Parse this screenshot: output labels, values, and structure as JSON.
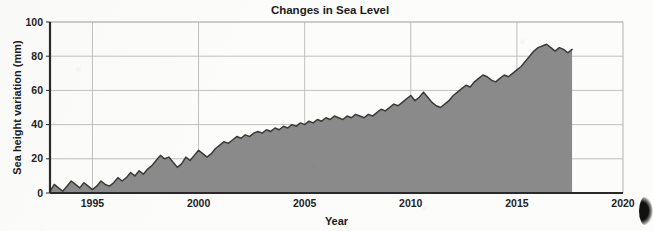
{
  "chart_data": {
    "type": "area",
    "title": "Changes in Sea Level",
    "xlabel": "Year",
    "ylabel": "Sea height variation (mm)",
    "xlim": [
      1993,
      2020
    ],
    "ylim": [
      0,
      100
    ],
    "xticks": [
      "1995",
      "2000",
      "2005",
      "2010",
      "2015",
      "2020"
    ],
    "xtick_values": [
      1995,
      2000,
      2005,
      2010,
      2015,
      2020
    ],
    "yticks": [
      "0",
      "20",
      "40",
      "60",
      "80",
      "100"
    ],
    "ytick_values": [
      0,
      20,
      40,
      60,
      80,
      100
    ],
    "grid": true,
    "legend": "none",
    "fill_color": "#8a8a8a",
    "line_color": "#3a3a3a",
    "grid_color": "#b9b9b9",
    "axis_color": "#2a2a2a",
    "data_start_year": 1993.0,
    "data_end_year": 2017.6,
    "series": [
      {
        "name": "Sea height variation",
        "units": "mm",
        "x": [
          1993.0,
          1993.2,
          1993.4,
          1993.6,
          1993.8,
          1994.0,
          1994.2,
          1994.4,
          1994.6,
          1994.8,
          1995.0,
          1995.2,
          1995.4,
          1995.6,
          1995.8,
          1996.0,
          1996.2,
          1996.4,
          1996.6,
          1996.8,
          1997.0,
          1997.2,
          1997.4,
          1997.6,
          1997.8,
          1998.0,
          1998.2,
          1998.4,
          1998.6,
          1998.8,
          1999.0,
          1999.2,
          1999.4,
          1999.6,
          1999.8,
          2000.0,
          2000.2,
          2000.4,
          2000.6,
          2000.8,
          2001.0,
          2001.2,
          2001.4,
          2001.6,
          2001.8,
          2002.0,
          2002.2,
          2002.4,
          2002.6,
          2002.8,
          2003.0,
          2003.2,
          2003.4,
          2003.6,
          2003.8,
          2004.0,
          2004.2,
          2004.4,
          2004.6,
          2004.8,
          2005.0,
          2005.2,
          2005.4,
          2005.6,
          2005.8,
          2006.0,
          2006.2,
          2006.4,
          2006.6,
          2006.8,
          2007.0,
          2007.2,
          2007.4,
          2007.6,
          2007.8,
          2008.0,
          2008.2,
          2008.4,
          2008.6,
          2008.8,
          2009.0,
          2009.2,
          2009.4,
          2009.6,
          2009.8,
          2010.0,
          2010.2,
          2010.4,
          2010.6,
          2010.8,
          2011.0,
          2011.2,
          2011.4,
          2011.6,
          2011.8,
          2012.0,
          2012.2,
          2012.4,
          2012.6,
          2012.8,
          2013.0,
          2013.2,
          2013.4,
          2013.6,
          2013.8,
          2014.0,
          2014.2,
          2014.4,
          2014.6,
          2014.8,
          2015.0,
          2015.2,
          2015.4,
          2015.6,
          2015.8,
          2016.0,
          2016.2,
          2016.4,
          2016.6,
          2016.8,
          2017.0,
          2017.2,
          2017.4,
          2017.6
        ],
        "y": [
          1,
          5,
          3,
          1,
          4,
          7,
          5,
          3,
          6,
          4,
          2,
          4,
          7,
          5,
          4,
          6,
          9,
          7,
          9,
          12,
          10,
          13,
          11,
          14,
          16,
          19,
          22,
          20,
          21,
          18,
          15,
          17,
          21,
          19,
          22,
          25,
          23,
          21,
          23,
          26,
          28,
          30,
          29,
          31,
          33,
          32,
          34,
          33,
          35,
          36,
          35,
          37,
          36,
          38,
          37,
          39,
          38,
          40,
          39,
          41,
          40,
          42,
          41,
          43,
          42,
          44,
          43,
          45,
          44,
          43,
          45,
          44,
          46,
          45,
          44,
          46,
          45,
          47,
          49,
          48,
          50,
          52,
          51,
          53,
          55,
          57,
          54,
          56,
          59,
          56,
          53,
          51,
          50,
          52,
          54,
          57,
          59,
          61,
          63,
          62,
          65,
          67,
          69,
          68,
          66,
          65,
          67,
          69,
          68,
          70,
          72,
          74,
          77,
          80,
          83,
          85,
          86,
          87,
          85,
          83,
          85,
          84,
          82,
          84
        ]
      }
    ]
  },
  "artifact": {
    "scan_edge_label": "scan-edge-artifact"
  }
}
